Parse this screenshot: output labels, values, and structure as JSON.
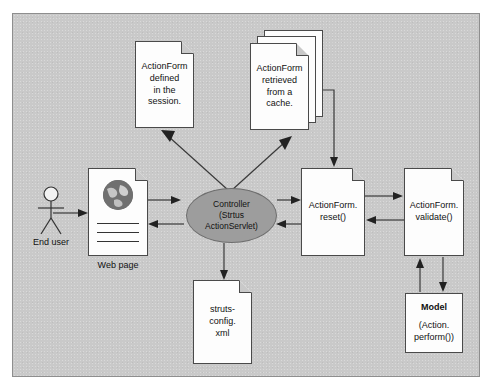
{
  "diagram": {
    "background_color": "#c9c9c9",
    "frame_border_color": "#8e8e8e",
    "accent_color": "#9d9d9d",
    "nodes": {
      "end_user": {
        "label": "End user",
        "icon": "stick-figure-icon"
      },
      "web_page": {
        "label": "Web page",
        "icon": "globe-icon"
      },
      "controller": {
        "line1": "Controller",
        "line2": "(Strtus",
        "line3": "ActionServlet)"
      },
      "action_form_session": {
        "line1": "ActionForm",
        "line2": "defined",
        "line3": "in the",
        "line4": "session."
      },
      "action_form_cache": {
        "line1": "ActionForm",
        "line2": "retrieved",
        "line3": "from a",
        "line4": "cache."
      },
      "struts_config": {
        "line1": "struts-config.",
        "line2": "xml"
      },
      "action_form_reset": {
        "line1": "ActionForm.",
        "line2": "reset()"
      },
      "action_form_validate": {
        "line1": "ActionForm.",
        "line2": "validate()"
      },
      "model": {
        "title": "Model",
        "line1": "(Action.",
        "line2": "perform())"
      }
    },
    "edges": [
      {
        "from": "end_user",
        "to": "web_page",
        "style": "solid-arrow"
      },
      {
        "from": "web_page",
        "to": "controller",
        "style": "solid-arrow"
      },
      {
        "from": "controller",
        "to": "web_page",
        "style": "solid-arrow"
      },
      {
        "from": "controller",
        "to": "action_form_session",
        "style": "solid-arrow"
      },
      {
        "from": "controller",
        "to": "action_form_cache",
        "style": "solid-arrow"
      },
      {
        "from": "controller",
        "to": "struts_config",
        "style": "solid-arrow"
      },
      {
        "from": "controller",
        "to": "action_form_reset",
        "style": "solid-arrow"
      },
      {
        "from": "action_form_reset",
        "to": "controller",
        "style": "solid-arrow"
      },
      {
        "from": "action_form_cache",
        "to": "action_form_reset",
        "style": "elbow-arrow"
      },
      {
        "from": "action_form_reset",
        "to": "action_form_validate",
        "style": "solid-arrow"
      },
      {
        "from": "action_form_validate",
        "to": "action_form_reset",
        "style": "solid-arrow"
      },
      {
        "from": "action_form_validate",
        "to": "model",
        "style": "solid-arrow"
      },
      {
        "from": "model",
        "to": "action_form_validate",
        "style": "solid-arrow"
      }
    ]
  }
}
